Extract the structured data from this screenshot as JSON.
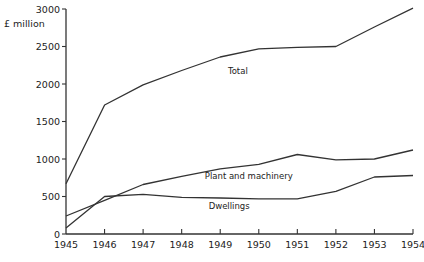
{
  "chart_data": {
    "type": "line",
    "title": "",
    "xlabel": "",
    "ylabel": "£ million",
    "xlim": [
      1945,
      1954
    ],
    "ylim": [
      0,
      3000
    ],
    "grid": false,
    "legend": "none (inline series labels)",
    "x": [
      1945,
      1946,
      1947,
      1948,
      1949,
      1950,
      1951,
      1952,
      1953,
      1954
    ],
    "x_tick_labels": [
      "1945",
      "1946",
      "1947",
      "1948",
      "1949",
      "1950",
      "1951",
      "1952",
      "1953",
      "1954"
    ],
    "y_ticks": [
      0,
      500,
      1000,
      1500,
      2000,
      2500,
      3000
    ],
    "y_tick_labels": [
      "0",
      "500",
      "1000",
      "1500",
      "2000",
      "2500",
      "3000"
    ],
    "series": [
      {
        "name": "Total",
        "label": "Total",
        "values": [
          670,
          1720,
          1990,
          2180,
          2360,
          2470,
          2490,
          2500,
          2760,
          3010
        ]
      },
      {
        "name": "Plant and machinery",
        "label": "Plant and machinery",
        "values": [
          240,
          450,
          660,
          770,
          870,
          930,
          1060,
          990,
          1000,
          1120
        ]
      },
      {
        "name": "Dwellings",
        "label": "Dwellings",
        "values": [
          80,
          500,
          530,
          490,
          480,
          470,
          470,
          570,
          760,
          780
        ]
      }
    ]
  }
}
